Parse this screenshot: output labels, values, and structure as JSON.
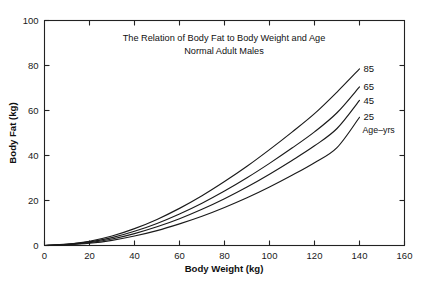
{
  "chart_data": {
    "type": "line",
    "title": "The Relation of Body Fat to Body Weight and Age",
    "subtitle": "Normal Adult Males",
    "xlabel": "Body Weight (kg)",
    "ylabel": "Body Fat (kg)",
    "xlim": [
      0,
      160
    ],
    "ylim": [
      0,
      100
    ],
    "xticks": [
      0,
      20,
      40,
      60,
      80,
      100,
      120,
      140,
      160
    ],
    "yticks": [
      0,
      20,
      40,
      60,
      80,
      100
    ],
    "grid": false,
    "legend_position": "inline-right-of-curve-ends",
    "legend_note": "Age–yrs",
    "x": [
      0,
      10,
      20,
      30,
      40,
      50,
      60,
      70,
      80,
      90,
      100,
      110,
      120,
      130,
      140
    ],
    "series": [
      {
        "name": "85",
        "label": "85",
        "age_years": 85,
        "values": [
          0,
          0.6,
          1.9,
          4.2,
          7.5,
          11.6,
          16.5,
          22.1,
          28.4,
          35.2,
          42.6,
          50.4,
          58.6,
          68.2,
          78.5
        ]
      },
      {
        "name": "65",
        "label": "65",
        "age_years": 65,
        "values": [
          0,
          0.5,
          1.6,
          3.5,
          6.3,
          9.8,
          14.0,
          18.8,
          24.2,
          30.1,
          36.5,
          43.3,
          50.5,
          59.0,
          70.5
        ]
      },
      {
        "name": "45",
        "label": "45",
        "age_years": 45,
        "values": [
          0,
          0.4,
          1.3,
          2.9,
          5.3,
          8.3,
          11.9,
          16.1,
          20.8,
          26.0,
          31.7,
          37.8,
          44.3,
          52.0,
          64.5
        ]
      },
      {
        "name": "25",
        "label": "25",
        "age_years": 25,
        "values": [
          0,
          0.3,
          1.0,
          2.3,
          4.2,
          6.6,
          9.6,
          13.0,
          16.9,
          21.2,
          26.0,
          31.2,
          36.8,
          43.5,
          57.0
        ]
      }
    ]
  },
  "colors": {
    "curve": "#1a1a1a",
    "axis": "#222222",
    "background": "#ffffff"
  }
}
